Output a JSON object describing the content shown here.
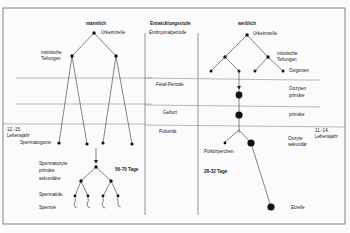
{
  "columns": {
    "male_title": "männlich",
    "stage_title": "Entwicklungsstufe",
    "female_title": "weiblich"
  },
  "stages": {
    "embryonal": "Embryonalperiode",
    "fetal": "Fetal-Periode",
    "birth": "Geburt",
    "puberty": "Pubertät"
  },
  "male": {
    "primordial_cell": "Urkeimzelle",
    "mitotic_1": "mitotische",
    "mitotic_2": "Teilungen",
    "age_1": "12.-15.",
    "age_2": "Lebensjahr",
    "spermatogonia": "Spermatogonie",
    "spermatocyte": "Spermatozyte",
    "primary": "primäre",
    "secondary": "sekundäre",
    "duration": "56-70 Tage",
    "spermatid": "Spermatide",
    "sperm": "Spermie"
  },
  "female": {
    "primordial_cell": "Urkeimzelle",
    "mitotic_1": "mitotische",
    "mitotic_2": "Teilungen",
    "oogonia": "Oogonien",
    "oocyte_1": "Oozyten",
    "oocyte_primary": "primäre",
    "primary_birth": "primäre",
    "age_1": "11.-14.",
    "age_2": "Lebensjahr",
    "oocyte_2": "Oozyte",
    "secondary": "sekundär",
    "polar_body": "Polkörperchen",
    "duration": "28-32 Tage",
    "egg": "Eizelle"
  },
  "colors": {
    "line": "#333333",
    "node": "#111111",
    "divider": "#666666",
    "frame": "#555555"
  }
}
